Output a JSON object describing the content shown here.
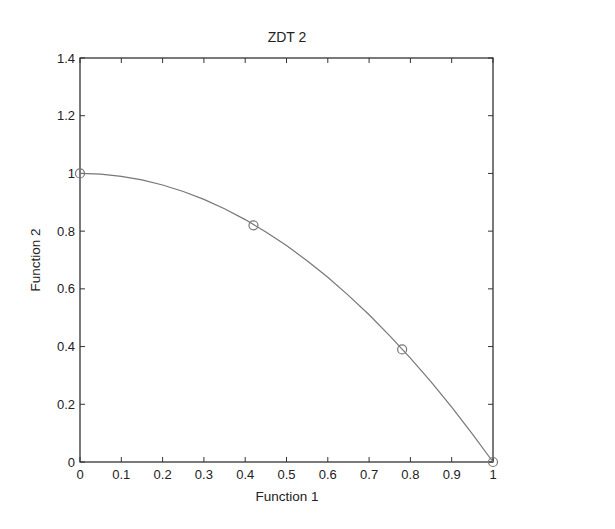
{
  "chart_data": {
    "type": "line",
    "title": "ZDT 2",
    "xlabel": "Function 1",
    "ylabel": "Function 2",
    "xlim": [
      0,
      1
    ],
    "ylim": [
      0,
      1.4
    ],
    "xticks": [
      "0",
      "0.1",
      "0.2",
      "0.3",
      "0.4",
      "0.5",
      "0.6",
      "0.7",
      "0.8",
      "0.9",
      "1"
    ],
    "yticks": [
      "0",
      "0.2",
      "0.4",
      "0.6",
      "0.8",
      "1",
      "1.2",
      "1.4"
    ],
    "grid": false,
    "legend": null,
    "series": [
      {
        "name": "Pareto front",
        "style": "line",
        "color": "#777777",
        "function": "f2 = 1 - f1^2",
        "x": [
          0,
          0.05,
          0.1,
          0.15,
          0.2,
          0.25,
          0.3,
          0.35,
          0.4,
          0.45,
          0.5,
          0.55,
          0.6,
          0.65,
          0.7,
          0.75,
          0.8,
          0.85,
          0.9,
          0.95,
          1.0
        ],
        "y": [
          1,
          0.9975,
          0.99,
          0.9775,
          0.96,
          0.9375,
          0.91,
          0.8775,
          0.84,
          0.7975,
          0.75,
          0.6975,
          0.64,
          0.5775,
          0.51,
          0.4375,
          0.36,
          0.2775,
          0.19,
          0.0975,
          0
        ]
      },
      {
        "name": "Solutions",
        "style": "marker-circle",
        "color": "#777777",
        "x": [
          0,
          0.42,
          0.78,
          1.0
        ],
        "y": [
          1.0,
          0.82,
          0.39,
          0.0
        ]
      }
    ]
  }
}
